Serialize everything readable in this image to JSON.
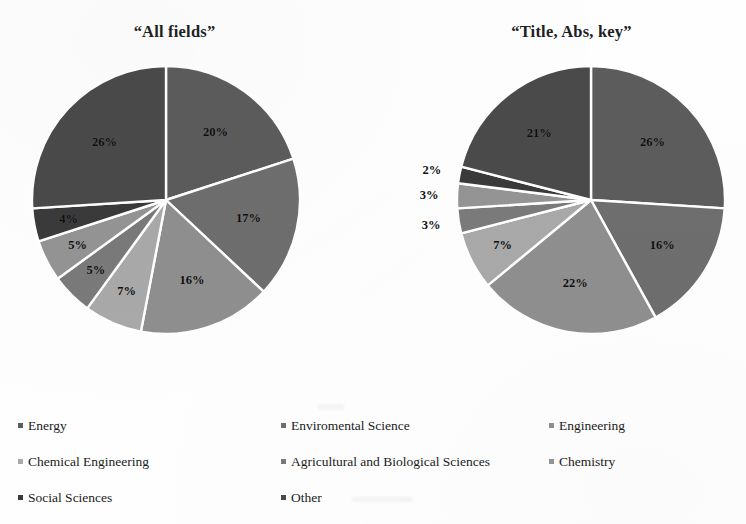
{
  "figure": {
    "background_color": "#fefefe",
    "legend_columns_x": [
      18,
      281,
      549
    ],
    "legend_rows_y": [
      14,
      50,
      86
    ]
  },
  "palette": {
    "energy": "#5c5c5c",
    "enviromental_science": "#6e6e6e",
    "engineering": "#8f8f8f",
    "chemical_engineering": "#a9a9a9",
    "agricultural_and_biological_sciences": "#7a7a7a",
    "chemistry": "#949494",
    "social_sciences": "#3a3a3a",
    "other": "#4a4a4a",
    "separator": "#ffffff"
  },
  "legend": {
    "items": [
      {
        "label": "Energy",
        "color": "#5c5c5c"
      },
      {
        "label": "Enviromental Science",
        "color": "#6e6e6e"
      },
      {
        "label": "Engineering",
        "color": "#8f8f8f"
      },
      {
        "label": "Chemical Engineering",
        "color": "#a9a9a9"
      },
      {
        "label": "Agricultural and Biological Sciences",
        "color": "#7a7a7a"
      },
      {
        "label": "Chemistry",
        "color": "#949494"
      },
      {
        "label": "Social Sciences",
        "color": "#3a3a3a"
      },
      {
        "label": "Other",
        "color": "#4a4a4a"
      }
    ]
  },
  "chart_data": [
    {
      "type": "pie",
      "title": "“All fields”",
      "labels": [
        "Energy",
        "Enviromental Science",
        "Engineering",
        "Chemical Engineering",
        "Agricultural and Biological Sciences",
        "Chemistry",
        "Social Sciences",
        "Other"
      ],
      "values": [
        20,
        17,
        16,
        7,
        5,
        5,
        4,
        26
      ],
      "value_labels": [
        "20%",
        "17%",
        "16%",
        "7%",
        "5%",
        "5%",
        "4%",
        "26%"
      ],
      "colors": [
        "#5c5c5c",
        "#6e6e6e",
        "#8f8f8f",
        "#a9a9a9",
        "#7a7a7a",
        "#949494",
        "#3a3a3a",
        "#4a4a4a"
      ],
      "label_placement": [
        "inside",
        "inside",
        "inside",
        "inside",
        "inside",
        "inside",
        "inside",
        "inside"
      ],
      "start_angle_deg": 0,
      "direction": "clockwise",
      "units": "percent",
      "legend_position": "bottom"
    },
    {
      "type": "pie",
      "title": "“Title, Abs, key”",
      "labels": [
        "Energy",
        "Enviromental Science",
        "Engineering",
        "Chemical Engineering",
        "Agricultural and Biological Sciences",
        "Chemistry",
        "Social Sciences",
        "Other"
      ],
      "values": [
        26,
        16,
        22,
        7,
        3,
        3,
        2,
        21
      ],
      "value_labels": [
        "26%",
        "16%",
        "22%",
        "7%",
        "3%",
        "3%",
        "2%",
        "21%"
      ],
      "colors": [
        "#5c5c5c",
        "#6e6e6e",
        "#8f8f8f",
        "#a9a9a9",
        "#7a7a7a",
        "#949494",
        "#3a3a3a",
        "#4a4a4a"
      ],
      "label_placement": [
        "inside",
        "inside",
        "inside",
        "inside",
        "outside",
        "outside",
        "outside",
        "inside"
      ],
      "start_angle_deg": 0,
      "direction": "clockwise",
      "units": "percent",
      "legend_position": "bottom"
    }
  ]
}
